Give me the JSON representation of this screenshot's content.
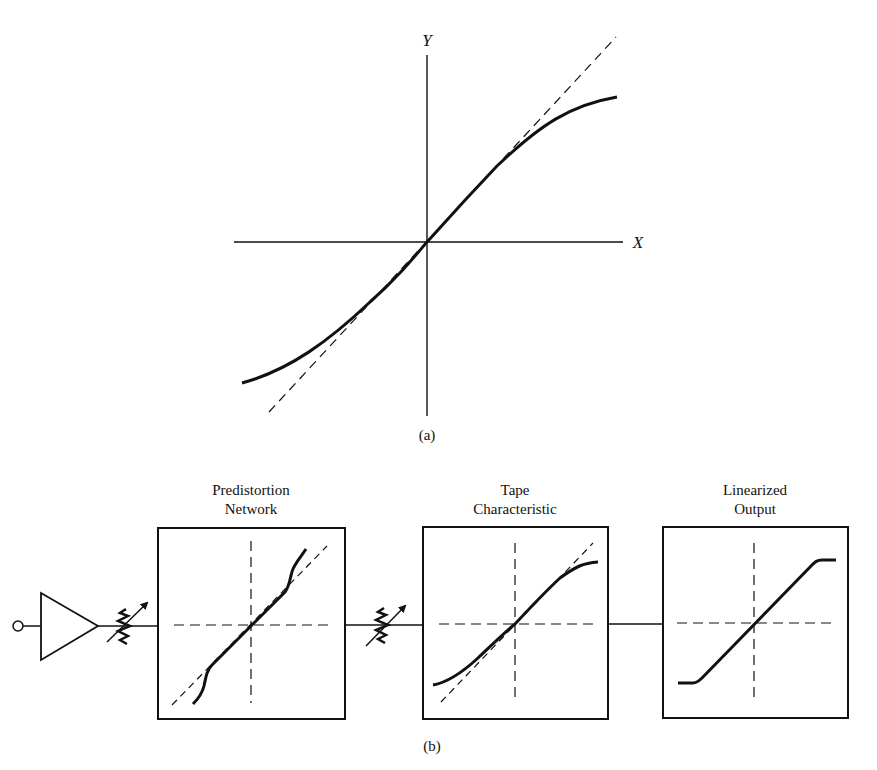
{
  "figure_a": {
    "caption": "(a)",
    "y_axis_label": "Y",
    "x_axis_label": "X",
    "curve_description": "Compressive S-shaped transfer characteristic through origin with dashed linear tangent"
  },
  "figure_b": {
    "caption": "(b)",
    "blocks": [
      {
        "title_line1": "Predistortion",
        "title_line2": "Network",
        "curve": "expansive predistortion"
      },
      {
        "title_line1": "Tape",
        "title_line2": "Characteristic",
        "curve": "compressive S-curve"
      },
      {
        "title_line1": "Linearized",
        "title_line2": "Output",
        "curve": "linear with hard limits"
      }
    ],
    "components": [
      "input-terminal",
      "amplifier",
      "variable-resistor",
      "variable-resistor"
    ]
  },
  "colors": {
    "ink": "#111111",
    "paper": "#ffffff"
  }
}
